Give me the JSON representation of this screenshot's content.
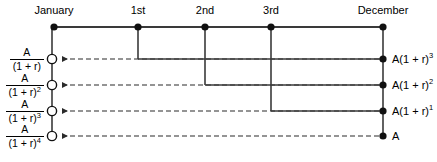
{
  "figure": {
    "type": "cash-flow-timeline-diagram",
    "width": 437,
    "height": 162,
    "background_color": "#ffffff",
    "line_color": "#3a3a3a",
    "text_color": "#000000"
  },
  "timeline": {
    "axis_y": 27,
    "start_x": 54,
    "end_x": 383,
    "nodes": [
      {
        "id": "january",
        "label": "January",
        "x": 54,
        "marker": "filled-dot"
      },
      {
        "id": "first",
        "label": "1st",
        "x": 138,
        "marker": "filled-dot"
      },
      {
        "id": "second",
        "label": "2nd",
        "x": 205,
        "marker": "filled-dot"
      },
      {
        "id": "third",
        "label": "3rd",
        "x": 271,
        "marker": "filled-dot"
      },
      {
        "id": "december",
        "label": "December",
        "x": 383,
        "marker": "filled-dot"
      }
    ]
  },
  "rows": [
    {
      "id": "row-1",
      "y": 59,
      "present_value": {
        "numerator": "A",
        "denominator_base": "(1 + r)",
        "denominator_exponent": ""
      },
      "future_value": {
        "text": "A(1 + r)",
        "exponent": "3"
      },
      "source_node": "first",
      "source_x": 138,
      "left_marker": "open-circle",
      "right_marker": "filled-dot",
      "arrow_direction": "left",
      "line_style": "dashed"
    },
    {
      "id": "row-2",
      "y": 85,
      "present_value": {
        "numerator": "A",
        "denominator_base": "(1 + r)",
        "denominator_exponent": "2"
      },
      "future_value": {
        "text": "A(1 + r)",
        "exponent": "2"
      },
      "source_node": "second",
      "source_x": 205,
      "left_marker": "open-circle",
      "right_marker": "filled-dot",
      "arrow_direction": "left",
      "line_style": "dashed"
    },
    {
      "id": "row-3",
      "y": 111,
      "present_value": {
        "numerator": "A",
        "denominator_base": "(1 + r)",
        "denominator_exponent": "3"
      },
      "future_value": {
        "text": "A(1 + r)",
        "exponent": "1"
      },
      "source_node": "third",
      "source_x": 271,
      "left_marker": "open-circle",
      "right_marker": "filled-dot",
      "arrow_direction": "left",
      "line_style": "dashed"
    },
    {
      "id": "row-4",
      "y": 136,
      "present_value": {
        "numerator": "A",
        "denominator_base": "(1 + r)",
        "denominator_exponent": "4"
      },
      "future_value": {
        "text": "A",
        "exponent": ""
      },
      "source_node": "december",
      "source_x": 383,
      "left_marker": "open-circle",
      "right_marker": "filled-dot",
      "arrow_direction": "left",
      "line_style": "dashed"
    }
  ],
  "left_rail": {
    "x": 52,
    "top_y": 27,
    "bottom_y": 136
  },
  "right_rail": {
    "x": 383,
    "top_y": 27,
    "bottom_y": 136
  }
}
